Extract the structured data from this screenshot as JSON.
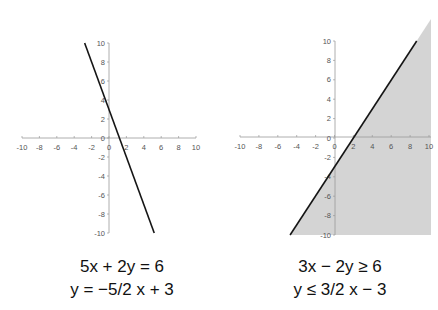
{
  "chart_data": [
    {
      "type": "line",
      "title": "",
      "equation": "5x + 2y = 6",
      "slope_intercept": "y = −5/2 x + 3",
      "xlim": [
        -10,
        10
      ],
      "ylim": [
        -10,
        10
      ],
      "x_ticks": [
        -10,
        -8,
        -6,
        -4,
        -2,
        0,
        2,
        4,
        6,
        8,
        10
      ],
      "y_ticks": [
        10,
        8,
        6,
        4,
        2,
        0,
        -2,
        -4,
        -6,
        -8,
        -10
      ],
      "series": [
        {
          "name": "y = -5/2x + 3",
          "x": [
            -2.8,
            5.2
          ],
          "y": [
            10,
            -10
          ],
          "color": "#111111"
        }
      ],
      "shaded": false,
      "grid": false
    },
    {
      "type": "area",
      "title": "",
      "equation": "3x − 2y ≥ 6",
      "slope_intercept": "y ≤ 3/2 x − 3",
      "xlim": [
        -10,
        10
      ],
      "ylim": [
        -10,
        10
      ],
      "x_ticks": [
        -10,
        -8,
        -6,
        -4,
        -2,
        0,
        2,
        4,
        6,
        8,
        10
      ],
      "y_ticks": [
        10,
        8,
        6,
        4,
        2,
        0,
        -2,
        -4,
        -6,
        -8,
        -10
      ],
      "series": [
        {
          "name": "y = 3/2x - 3",
          "x": [
            -4.7,
            8.7
          ],
          "y": [
            -10,
            10
          ],
          "color": "#111111"
        }
      ],
      "shaded": true,
      "shade_color": "#d4d4d4",
      "shade_region": "below line (y ≤ 3/2x − 3)",
      "grid": false
    }
  ],
  "captions": {
    "left_line1": "5x + 2y = 6",
    "left_line2": "y = −5/2 x + 3",
    "right_line1": "3x − 2y ≥ 6",
    "right_line2": "y ≤ 3/2 x − 3"
  }
}
